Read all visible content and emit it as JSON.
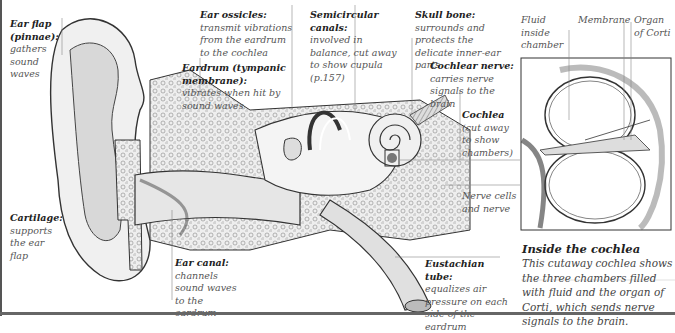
{
  "diagram": {
    "labels": [
      {
        "id": "ear-flap",
        "title": "Ear flap (pinnae):",
        "desc": "gathers sound waves"
      },
      {
        "id": "ear-ossicles",
        "title": "Ear ossicles:",
        "desc": "transmit vibrations from the eardrum to the cochlea"
      },
      {
        "id": "eardrum",
        "title": "Eardrum (tympanic membrane):",
        "desc": "vibrates when hit by sound waves"
      },
      {
        "id": "semicircular-canals",
        "title": "Semicircular canals:",
        "desc": "involved in balance, cut away to show cupula (p.157)"
      },
      {
        "id": "skull-bone",
        "title": "Skull bone:",
        "desc": "surrounds and protects the delicate inner-ear parts"
      },
      {
        "id": "cochlear-nerve",
        "title": "Cochlear nerve:",
        "desc": "carries nerve signals to the brain"
      },
      {
        "id": "cochlea",
        "title": "Cochlea",
        "desc": "(cut away to show chambers)"
      },
      {
        "id": "nerve-cells",
        "title": "",
        "desc": "Nerve cells and nerve"
      },
      {
        "id": "cartilage",
        "title": "Cartilage:",
        "desc": "supports the ear flap"
      },
      {
        "id": "ear-canal",
        "title": "Ear canal:",
        "desc": "channels sound waves to the eardrum"
      },
      {
        "id": "eustachian-tube",
        "title": "Eustachian tube:",
        "desc": "equalizes air pressure on each side of the eardrum"
      }
    ],
    "inset": {
      "labels": [
        "Fluid inside chamber",
        "Membrane",
        "Organ of Corti"
      ],
      "caption_title": "Inside the cochlea",
      "caption_body": "This cutaway cochlea shows the three chambers filled with fluid and the organ of Corti, which sends nerve signals to the brain."
    }
  }
}
